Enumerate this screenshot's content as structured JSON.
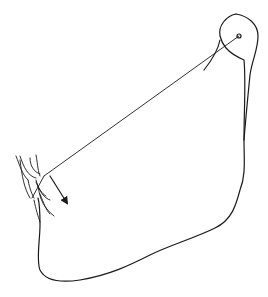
{
  "diagram": {
    "stroke_color": "#1a1a1a",
    "background": "#ffffff",
    "outline_path": "M 236 14 C 226 16 218 26 220 36 C 222 44 226 52 244 60 C 246 80 244 110 244 140 C 244 160 246 175 240 190 C 236 205 232 220 215 228 C 195 238 170 245 150 255 C 130 265 110 275 80 280 C 60 283 45 280 40 270 C 36 260 40 240 40 225 C 40 215 40 205 38 198",
    "condyle_path": "M 236 14 C 248 16 258 24 258 36 C 258 50 252 60 250 75 C 248 95 246 115 244 140",
    "hook_path": "M 220 40 C 218 50 212 60 204 70",
    "pivot": {
      "cx": 239,
      "cy": 36,
      "r": 2
    },
    "line": {
      "x1": 239,
      "y1": 36,
      "x2": 44,
      "y2": 176
    },
    "arrow": {
      "x1": 50,
      "y1": 176,
      "x2": 67,
      "y2": 203
    },
    "tooth_paths": [
      "M 16 156 C 20 166 22 174 28 180",
      "M 20 156 C 24 168 28 176 36 178",
      "M 30 158 C 30 166 34 172 40 174",
      "M 36 155 C 38 166 38 172 40 176",
      "M 20 160 C 22 176 24 188 30 198",
      "M 28 180 C 30 190 32 194 34 198",
      "M 36 180 C 38 188 42 194 46 196",
      "M 36 182 C 40 192 44 198 50 200",
      "M 38 186 C 40 200 44 208 54 216",
      "M 40 194 C 44 204 46 210 50 214",
      "M 34 200 C 36 210 38 216 40 222",
      "M 44 176 L 32 198"
    ]
  }
}
